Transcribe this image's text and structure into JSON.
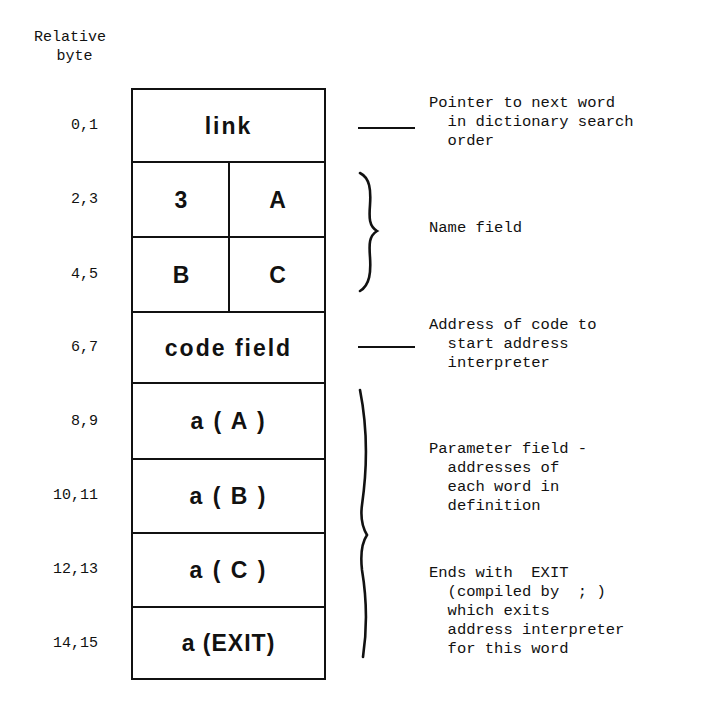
{
  "header": {
    "line1": "Relative",
    "line2": "byte"
  },
  "rows": [
    {
      "bytes": "0,1",
      "label": "link"
    },
    {
      "bytes": "2,3",
      "left": "3",
      "right": "A"
    },
    {
      "bytes": "4,5",
      "left": "B",
      "right": "C"
    },
    {
      "bytes": "6,7",
      "label": "code field"
    },
    {
      "bytes": "8,9",
      "label": "a ( A )"
    },
    {
      "bytes": "10,11",
      "label": "a ( B )"
    },
    {
      "bytes": "12,13",
      "label": "a ( C )"
    },
    {
      "bytes": "14,15",
      "label": "a (EXIT)"
    }
  ],
  "annotations": {
    "link": [
      "Pointer to next word",
      "  in dictionary search",
      "  order"
    ],
    "name": [
      "Name field"
    ],
    "code": [
      "Address of code to",
      "  start address",
      "  interpreter"
    ],
    "param": [
      "Parameter field -",
      "  addresses of",
      "  each word in",
      "  definition"
    ],
    "exit": [
      "Ends with  EXIT",
      "  (compiled by  ; )",
      "  which exits",
      "  address interpreter",
      "  for this word"
    ]
  },
  "colors": {
    "ink": "#111111",
    "paper": "#ffffff"
  }
}
